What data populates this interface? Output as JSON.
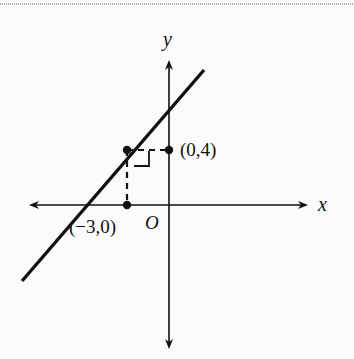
{
  "diagram": {
    "type": "coordinate-plane",
    "axes": {
      "x_label": "x",
      "y_label": "y",
      "origin_label": "O"
    },
    "points": [
      {
        "label": "(0,4)",
        "role": "y-axis foot of perpendicular"
      },
      {
        "label": "(−3,0)",
        "role": "x-axis foot of perpendicular"
      }
    ],
    "line": {
      "description": "line with positive slope crossing the x-axis left of (−3,0)"
    },
    "colors": {
      "ink": "#111111",
      "background": "#fbfbfb"
    }
  }
}
